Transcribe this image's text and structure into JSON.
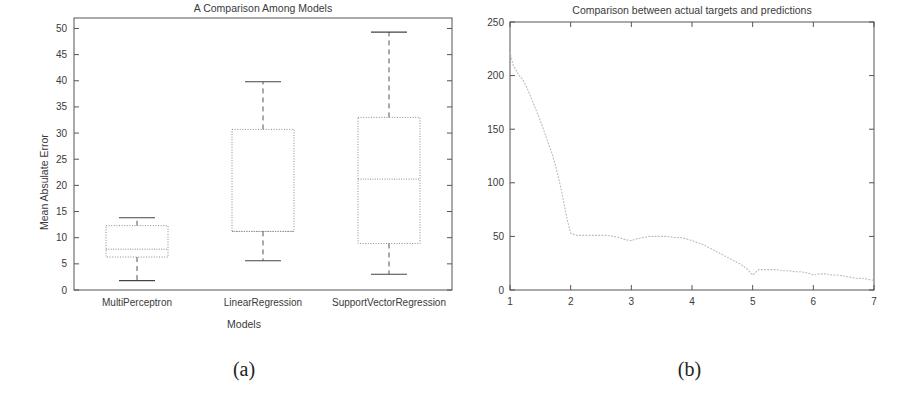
{
  "figure": {
    "subfigures": [
      {
        "caption": "(a)"
      },
      {
        "caption": "(b)"
      }
    ]
  },
  "chart_data": [
    {
      "type": "box",
      "title": "A Comparison Among Models",
      "xlabel": "Models",
      "ylabel": "Mean Absulate Error",
      "categories": [
        "MultiPerceptron",
        "LinearRegression",
        "SupportVectorRegression"
      ],
      "ytick_labels": [
        "0",
        "5",
        "10",
        "15",
        "20",
        "25",
        "30",
        "35",
        "40",
        "45",
        "50"
      ],
      "yticks": [
        0,
        5,
        10,
        15,
        20,
        25,
        30,
        35,
        40,
        45,
        50
      ],
      "ylim": [
        0,
        52
      ],
      "grid": false,
      "legend": "none",
      "boxes": [
        {
          "name": "MultiPerceptron",
          "whisker_low": 1.8,
          "q1": 6.3,
          "median": 7.8,
          "q3": 12.3,
          "whisker_high": 13.8
        },
        {
          "name": "LinearRegression",
          "whisker_low": 5.6,
          "q1": 11.2,
          "median": 11.2,
          "q3": 30.7,
          "whisker_high": 39.8
        },
        {
          "name": "SupportVectorRegression",
          "whisker_low": 3.0,
          "q1": 8.9,
          "median": 21.2,
          "q3": 33.0,
          "whisker_high": 49.3
        }
      ]
    },
    {
      "type": "line",
      "title": "Comparison between actual targets and predictions",
      "xlabel": "",
      "ylabel": "",
      "xtick_labels": [
        "1",
        "2",
        "3",
        "4",
        "5",
        "6",
        "7"
      ],
      "xticks": [
        1,
        2,
        3,
        4,
        5,
        6,
        7
      ],
      "ytick_labels": [
        "0",
        "50",
        "100",
        "150",
        "200",
        "250"
      ],
      "yticks": [
        0,
        50,
        100,
        150,
        200,
        250
      ],
      "xlim": [
        1,
        7
      ],
      "ylim": [
        0,
        250
      ],
      "grid": false,
      "legend": "none",
      "series": [
        {
          "name": "prediction-curve",
          "x": [
            1.0,
            1.05,
            1.1,
            1.15,
            1.2,
            1.25,
            1.3,
            1.35,
            1.4,
            1.45,
            1.5,
            1.55,
            1.6,
            1.65,
            1.7,
            1.75,
            1.8,
            1.85,
            1.9,
            1.95,
            2.0,
            2.1,
            2.2,
            2.3,
            2.4,
            2.5,
            2.6,
            2.7,
            2.8,
            2.9,
            3.0,
            3.1,
            3.2,
            3.3,
            3.4,
            3.5,
            3.6,
            3.7,
            3.8,
            3.9,
            4.0,
            4.1,
            4.2,
            4.3,
            4.4,
            4.5,
            4.6,
            4.7,
            4.8,
            4.9,
            5.0,
            5.1,
            5.2,
            5.3,
            5.4,
            5.5,
            5.6,
            5.7,
            5.8,
            5.9,
            6.0,
            6.1,
            6.2,
            6.3,
            6.4,
            6.5,
            6.6,
            6.7,
            6.8,
            6.9,
            7.0
          ],
          "y": [
            222,
            210,
            205,
            200,
            197,
            192,
            186,
            179,
            172,
            165,
            158,
            150,
            142,
            134,
            126,
            116,
            105,
            92,
            78,
            64,
            53,
            51,
            51,
            51,
            51,
            51,
            51,
            50,
            49,
            47,
            46,
            48,
            49,
            50,
            50,
            50,
            50,
            49,
            49,
            48,
            46,
            44,
            42,
            39,
            36,
            33,
            30,
            27,
            24,
            20,
            14,
            19,
            19,
            19,
            19,
            18,
            18,
            17,
            17,
            16,
            14,
            15,
            15,
            14,
            14,
            13,
            12,
            11,
            11,
            10,
            9
          ]
        }
      ]
    }
  ]
}
